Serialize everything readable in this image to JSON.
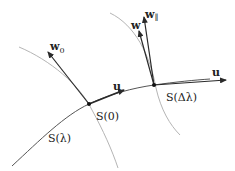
{
  "diagram": {
    "title": "",
    "colors": {
      "curve": "#555555",
      "transversal": "#b5b5b5",
      "vector": "#2a2a2a",
      "point": "#111111",
      "text": "#222222"
    },
    "curve_label": "S(λ)",
    "points": [
      {
        "label": "S(0)"
      },
      {
        "label": "S(Δλ)"
      }
    ],
    "vectors": {
      "w0": {
        "base": "w",
        "sub": "0"
      },
      "u_at_0": {
        "label": "u"
      },
      "w": {
        "label": "w"
      },
      "w_par": {
        "base": "w",
        "sub": "∥"
      },
      "u_at_dl": {
        "label": "u"
      }
    }
  }
}
